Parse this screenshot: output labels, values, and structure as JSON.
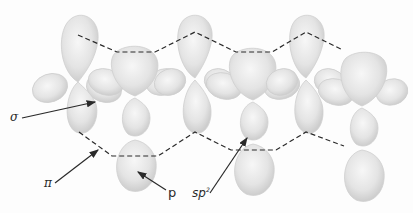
{
  "diagram": {
    "atom_count": 6,
    "colors": {
      "background": "#fdfdfd",
      "orbital_fill": "#e2e2e2",
      "orbital_edge": "#c4c4c4",
      "bond_dash": "#2a2a2a",
      "arrow": "#2a2a2a",
      "text": "#2a2a2a"
    },
    "labels": {
      "sigma": "σ",
      "pi": "π",
      "p": "p",
      "sp2_base": "sp",
      "sp2_sup": "2"
    }
  }
}
